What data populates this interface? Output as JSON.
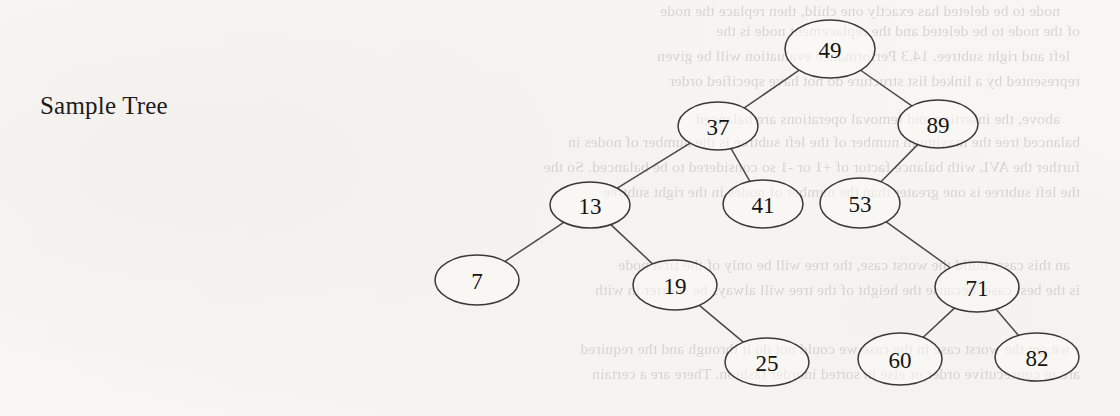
{
  "page": {
    "width": 1120,
    "height": 416,
    "background_color": "#f7f6f3",
    "ink_color": "#141312",
    "scan_type": "book-page-scan-with-bleedthrough"
  },
  "caption": {
    "text": "Sample Tree",
    "x": 40,
    "y": 92
  },
  "tree": {
    "type": "binary-search-tree",
    "node_fill": "#fbfaf8",
    "node_stroke": "#3b3937",
    "edge_stroke": "#4a4846",
    "nodes": [
      {
        "id": "n49",
        "value": "49",
        "cx": 830,
        "cy": 49,
        "rx": 45,
        "ry": 29
      },
      {
        "id": "n37",
        "value": "37",
        "cx": 718,
        "cy": 126,
        "rx": 40,
        "ry": 24
      },
      {
        "id": "n89",
        "value": "89",
        "cx": 938,
        "cy": 124,
        "rx": 40,
        "ry": 24
      },
      {
        "id": "n13",
        "value": "13",
        "cx": 590,
        "cy": 205,
        "rx": 40,
        "ry": 23
      },
      {
        "id": "n41",
        "value": "41",
        "cx": 763,
        "cy": 204,
        "rx": 40,
        "ry": 24
      },
      {
        "id": "n53",
        "value": "53",
        "cx": 860,
        "cy": 203,
        "rx": 40,
        "ry": 25
      },
      {
        "id": "n7",
        "value": "7",
        "cx": 477,
        "cy": 280,
        "rx": 42,
        "ry": 25
      },
      {
        "id": "n19",
        "value": "19",
        "cx": 675,
        "cy": 285,
        "rx": 42,
        "ry": 25
      },
      {
        "id": "n71",
        "value": "71",
        "cx": 977,
        "cy": 287,
        "rx": 42,
        "ry": 25
      },
      {
        "id": "n25",
        "value": "25",
        "cx": 767,
        "cy": 362,
        "rx": 42,
        "ry": 24
      },
      {
        "id": "n60",
        "value": "60",
        "cx": 900,
        "cy": 359,
        "rx": 42,
        "ry": 26
      },
      {
        "id": "n82",
        "value": "82",
        "cx": 1037,
        "cy": 357,
        "rx": 42,
        "ry": 24
      }
    ],
    "edges": [
      {
        "from": "n49",
        "to": "n37",
        "side": "left"
      },
      {
        "from": "n49",
        "to": "n89",
        "side": "right"
      },
      {
        "from": "n37",
        "to": "n13",
        "side": "left"
      },
      {
        "from": "n37",
        "to": "n41",
        "side": "right"
      },
      {
        "from": "n89",
        "to": "n53",
        "side": "left"
      },
      {
        "from": "n13",
        "to": "n7",
        "side": "left"
      },
      {
        "from": "n13",
        "to": "n19",
        "side": "right"
      },
      {
        "from": "n19",
        "to": "n25",
        "side": "right"
      },
      {
        "from": "n53",
        "to": "n71",
        "side": "right"
      },
      {
        "from": "n71",
        "to": "n60",
        "side": "left"
      },
      {
        "from": "n71",
        "to": "n82",
        "side": "right"
      }
    ]
  },
  "ghost_text": {
    "description": "faint mirrored bleed-through text from the reverse side of the scanned page",
    "lines": [
      {
        "text": "node to be deleted has exactly one child, then replace the node",
        "x": 60,
        "y": 2
      },
      {
        "text": "of the node to be deleted and the replacement node is the",
        "x": 40,
        "y": 22
      },
      {
        "text": "left and right subtree. 14.3 Performance evaluation will be given",
        "x": 50,
        "y": 47
      },
      {
        "text": "represented by a linked list structure do not have specified order",
        "x": 40,
        "y": 72
      },
      {
        "text": "above, the insertion and removal operations are balanced",
        "x": 60,
        "y": 110
      },
      {
        "text": "balanced tree the maximum number of the left subtree is the number of nodes in",
        "x": 40,
        "y": 133
      },
      {
        "text": "further the AVL with balance factor of +1 or -1 so considered to be balanced. So the",
        "x": 40,
        "y": 158
      },
      {
        "text": "the left subtree is one greater than the number of nodes in the right subtree",
        "x": 40,
        "y": 183
      },
      {
        "text": "an this case, build the worst case, the tree will be only of the first node",
        "x": 50,
        "y": 256
      },
      {
        "text": "is the best case, because the height of the tree will always be shorter in with",
        "x": 40,
        "y": 281
      },
      {
        "text": "we get the worst case in the case we could not do it through and the required",
        "x": 50,
        "y": 340
      },
      {
        "text": "are in consecutive order or else in sorted inorder fashion. There are a certain",
        "x": 40,
        "y": 365
      }
    ]
  }
}
